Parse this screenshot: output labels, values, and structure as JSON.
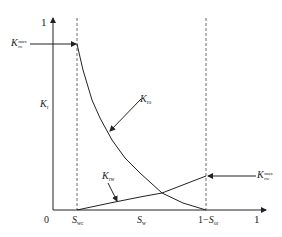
{
  "diagram": {
    "type": "relative-permeability-curves",
    "y_axis": {
      "label_main": "K",
      "label_sub": "r",
      "top_tick": "1"
    },
    "x_axis": {
      "origin": "0",
      "swc_main": "S",
      "swc_sub": "wc",
      "sw_main": "S",
      "sw_sub": "w",
      "sor_prefix": "1−",
      "sor_main": "S",
      "sor_sub": "or",
      "end_tick": "1"
    },
    "curves": {
      "kro": {
        "main": "K",
        "sub": "ro"
      },
      "krw": {
        "main": "K",
        "sub": "rw"
      }
    },
    "endpoints": {
      "kro_max": {
        "main": "K",
        "sup": "max",
        "sub": "ro"
      },
      "krw_max": {
        "main": "K",
        "sup": "max",
        "sub": "rw"
      }
    },
    "colors": {
      "line": "#222222",
      "dashed": "#444444"
    }
  }
}
